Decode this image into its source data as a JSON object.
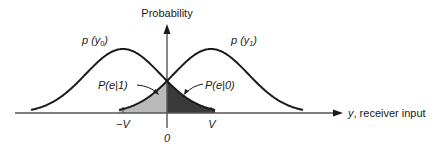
{
  "diagram": {
    "type": "probability-density-overlap",
    "y_axis_label": "Probability",
    "x_axis_label": "y, receiver input",
    "curves": [
      {
        "id": "p_y0",
        "label_main": "p",
        "label_open": " (",
        "label_var": "y",
        "label_sub": "0",
        "label_close": ")",
        "center": "-V"
      },
      {
        "id": "p_y1",
        "label_main": "p",
        "label_open": " (",
        "label_var": "y",
        "label_sub": "1",
        "label_close": ")",
        "center": "V"
      }
    ],
    "error_regions": [
      {
        "id": "pe1",
        "label": "P(e|1)",
        "shade": "#b9b9b9",
        "range": "-V to 0"
      },
      {
        "id": "pe0",
        "label": "P(e|0)",
        "shade": "#3a3a3a",
        "range": "0 to V"
      }
    ],
    "ticks": [
      {
        "label": "−V"
      },
      {
        "label": "0"
      },
      {
        "label": "V"
      }
    ],
    "colors": {
      "line": "#1a1a1a",
      "axis": "#555555",
      "light_shade": "#b9b9b9",
      "dark_shade": "#3a3a3a"
    }
  }
}
